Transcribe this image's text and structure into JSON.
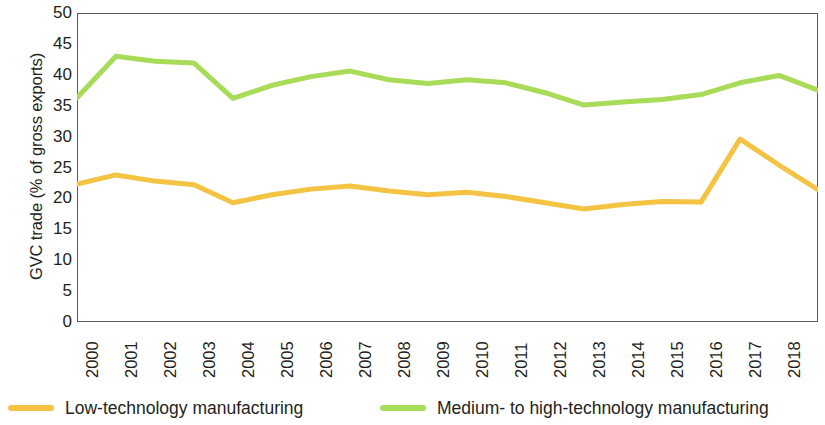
{
  "chart_data": {
    "type": "line",
    "title": "",
    "xlabel": "",
    "ylabel": "GVC trade (% of gross exports)",
    "x": [
      "2000",
      "2001",
      "2002",
      "2003",
      "2004",
      "2005",
      "2006",
      "2007",
      "2008",
      "2009",
      "2010",
      "2011",
      "2012",
      "2013",
      "2014",
      "2015",
      "2016",
      "2017",
      "2018",
      "2019"
    ],
    "categories": [
      "2000",
      "2001",
      "2002",
      "2003",
      "2004",
      "2005",
      "2006",
      "2007",
      "2008",
      "2009",
      "2010",
      "2011",
      "2012",
      "2013",
      "2014",
      "2015",
      "2016",
      "2017",
      "2018",
      "2019"
    ],
    "series": [
      {
        "name": "Low-technology manufacturing",
        "color": "#F5C344",
        "values": [
          22.3,
          23.8,
          22.8,
          22.2,
          19.3,
          20.6,
          21.5,
          22.0,
          21.2,
          20.6,
          21.0,
          20.3,
          19.3,
          18.3,
          19.0,
          19.5,
          19.4,
          29.6,
          25.4,
          21.4
        ]
      },
      {
        "name": "Medium- to high-technology manufacturing",
        "color": "#A8DC58",
        "values": [
          36.3,
          43.0,
          42.2,
          41.9,
          36.2,
          38.3,
          39.7,
          40.6,
          39.2,
          38.6,
          39.2,
          38.7,
          37.1,
          35.1,
          35.6,
          36.0,
          36.8,
          38.7,
          39.9,
          37.5
        ]
      }
    ],
    "ylim": [
      0,
      50
    ],
    "yticks": [
      "0",
      "5",
      "10",
      "15",
      "20",
      "25",
      "30",
      "35",
      "40",
      "45",
      "50"
    ],
    "ytick_values": [
      0,
      5,
      10,
      15,
      20,
      25,
      30,
      35,
      40,
      45,
      50
    ],
    "grid": false,
    "legend_position": "bottom"
  },
  "legend": {
    "items": [
      {
        "label": "Low-technology manufacturing",
        "color": "#F5C344"
      },
      {
        "label": "Medium- to high-technology manufacturing",
        "color": "#A8DC58"
      }
    ]
  },
  "axes": {
    "y_title": "GVC trade (% of gross exports)"
  },
  "colors": {
    "low_tech": "#F5C344",
    "medium_high_tech": "#A8DC58",
    "frame": "#58595b",
    "text": "#231f20"
  }
}
